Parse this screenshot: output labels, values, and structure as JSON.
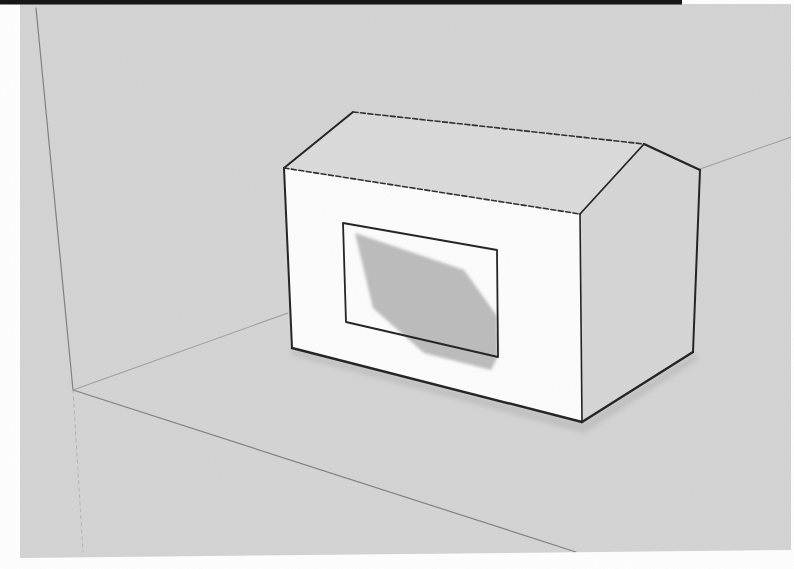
{
  "meta": {
    "viewport": {
      "width": 794,
      "height": 569
    }
  },
  "colors": {
    "page_white": "#ffffff",
    "scan_bar_black": "#161616",
    "canvas_gray": "#d4d4d4",
    "top_face": "#dbdbdb",
    "right_face": "#d6d6d6",
    "front_face": "#fdfdfd",
    "window_white": "#fdfdfd",
    "window_shadow": "#bcbcbc",
    "edge_dark": "#222222",
    "edge_dashed": "#2e2e2e",
    "faint_line": "#9e9e9e",
    "corner_line": "#7f7f7f",
    "dotted_line": "#b3b3b3",
    "ground_shadow": "rgba(0,0,0,0.09)"
  },
  "scan_frame": {
    "canvas_polygon": "20,4 791,4 791,550 20,558",
    "top_bar": {
      "x": 0,
      "y": 0,
      "width": 682,
      "height": 4.5
    }
  },
  "background_lines": [
    {
      "name": "room-corner-vertical-edge",
      "points": "36,8 73,390",
      "stroke_key": "corner_line",
      "width": 1.2,
      "dash": ""
    },
    {
      "name": "ground-back-edge-left",
      "points": "73,390 288,313",
      "stroke_key": "faint_line",
      "width": 1.1,
      "dash": ""
    },
    {
      "name": "ground-back-edge-right",
      "points": "700,169 794,136",
      "stroke_key": "faint_line",
      "width": 1.1,
      "dash": ""
    },
    {
      "name": "ground-front-edge",
      "points": "73,390 576,552",
      "stroke_key": "corner_line",
      "width": 1.2,
      "dash": ""
    },
    {
      "name": "room-corner-lower-edge",
      "points": "73,390 83,552",
      "stroke_key": "dotted_line",
      "width": 1,
      "dash": "3 4"
    }
  ],
  "ground_shadow_polygon": "292,349 582,423 695,353 699,359 584,433 291,355",
  "house": {
    "faces": [
      {
        "name": "house-top-face",
        "points": "284,168 353,112 644,144 580,214",
        "fill_key": "top_face"
      },
      {
        "name": "house-right-face",
        "points": "580,214 644,144 700,170 693,352 582,422",
        "fill_key": "right_face"
      },
      {
        "name": "house-front-face",
        "points": "284,168 580,214 582,422 292,348",
        "fill_key": "front_face"
      }
    ],
    "edges": [
      {
        "name": "front-left-edge",
        "points": "284,168 292,348",
        "stroke_key": "edge_dark",
        "width": 2,
        "dash": ""
      },
      {
        "name": "front-bottom-edge",
        "points": "292,348 582,422",
        "stroke_key": "edge_dark",
        "width": 2.4,
        "dash": ""
      },
      {
        "name": "roof-left-edge",
        "points": "284,168 353,112",
        "stroke_key": "edge_dark",
        "width": 2,
        "dash": ""
      },
      {
        "name": "roof-back-edge",
        "points": "353,112 644,144",
        "stroke_key": "edge_dashed",
        "width": 1.6,
        "dash": "5 2.5"
      },
      {
        "name": "roof-front-edge",
        "points": "284,168 580,214",
        "stroke_key": "edge_dashed",
        "width": 1.6,
        "dash": "5 2.5"
      },
      {
        "name": "chamfer-top-edge",
        "points": "644,144 700,170",
        "stroke_key": "edge_dark",
        "width": 2.4,
        "dash": ""
      },
      {
        "name": "chamfer-slope-edge",
        "points": "644,144 580,214",
        "stroke_key": "edge_dark",
        "width": 1.8,
        "dash": ""
      },
      {
        "name": "back-right-edge",
        "points": "700,170 693,352",
        "stroke_key": "edge_dark",
        "width": 2,
        "dash": ""
      },
      {
        "name": "right-bottom-edge",
        "points": "693,352 582,422",
        "stroke_key": "edge_dark",
        "width": 2.4,
        "dash": ""
      },
      {
        "name": "front-right-edge",
        "points": "580,214 582,422",
        "stroke_key": "edge_dark",
        "width": 1.6,
        "dash": ""
      }
    ]
  },
  "window": {
    "frame_polygon": "343,223 497,250 498,357 346,322",
    "frame_stroke_key": "edge_dark",
    "frame_width": 1.8,
    "shadow_polygon": "355,233 464,270 497,316 498,356 491,370 424,353 373,308"
  }
}
